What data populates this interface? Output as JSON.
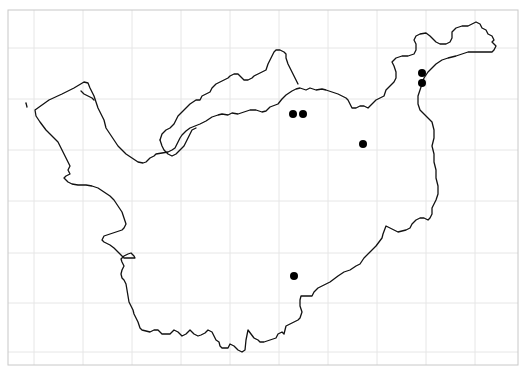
{
  "map": {
    "width": 524,
    "height": 373,
    "background": "#ffffff",
    "frame": {
      "x": 8,
      "y": 10,
      "width": 510,
      "height": 355,
      "color": "#c8c8c8"
    },
    "grid": {
      "color": "#e6e6e6",
      "vertical_x": [
        34,
        83,
        132,
        181,
        230,
        279,
        328,
        377,
        426,
        475
      ],
      "horizontal_y": [
        48,
        99,
        150,
        201,
        253,
        303,
        352
      ]
    },
    "outline_color": "#111111",
    "points": [
      {
        "x": 293,
        "y": 114,
        "r": 4
      },
      {
        "x": 303,
        "y": 114,
        "r": 4
      },
      {
        "x": 363,
        "y": 144,
        "r": 4
      },
      {
        "x": 294,
        "y": 276,
        "r": 4
      },
      {
        "x": 422,
        "y": 73,
        "r": 4
      },
      {
        "x": 422,
        "y": 83,
        "r": 4
      }
    ],
    "point_color": "#000000"
  }
}
